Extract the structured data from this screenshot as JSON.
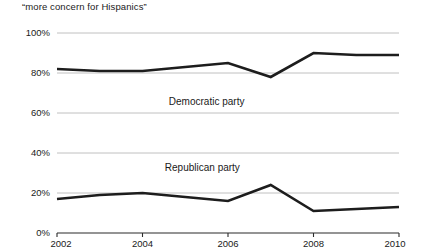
{
  "caption": "“more concern for Hispanics”",
  "chart_data": {
    "type": "line",
    "title": "“more concern for Hispanics”",
    "xlabel": "",
    "ylabel": "",
    "xlim": [
      2002,
      2010
    ],
    "ylim": [
      0,
      100
    ],
    "xticks": [
      "2002",
      "2004",
      "2006",
      "2008",
      "2010"
    ],
    "yticks": [
      "0%",
      "20%",
      "40%",
      "60%",
      "80%",
      "100%"
    ],
    "ytick_values": [
      0,
      20,
      40,
      60,
      80,
      100
    ],
    "xtick_values": [
      2002,
      2004,
      2006,
      2008,
      2010
    ],
    "grid": true,
    "legend": "inline-labels",
    "x": [
      2002,
      2003,
      2004,
      2005,
      2006,
      2007,
      2008,
      2009,
      2010
    ],
    "series": [
      {
        "name": "Democratic party",
        "label": "Democratic party",
        "color": "#1d1d1d",
        "values": [
          82,
          81,
          81,
          83,
          85,
          78,
          90,
          89,
          89
        ],
        "label_x": 2005.5,
        "label_y": 64
      },
      {
        "name": "Republican party",
        "label": "Republican party",
        "color": "#1d1d1d",
        "values": [
          17,
          19,
          20,
          18,
          16,
          24,
          11,
          12,
          13
        ],
        "label_x": 2005.4,
        "label_y": 31
      }
    ]
  },
  "colors": {
    "background": "#ffffff",
    "line": "#1d1d1d",
    "grid": "#b9b9b9",
    "axis": "#2b2b2b",
    "text": "#1a1a1a"
  }
}
